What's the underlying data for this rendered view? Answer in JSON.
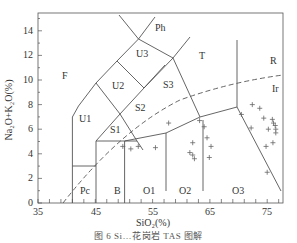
{
  "figure": {
    "caption": "图 6  Si…花岗岩 TAS 图解"
  },
  "axes": {
    "xlabel": "SiO₂(%)",
    "ylabel": "Na₂O+K₂O(%)",
    "xticks": [
      "35",
      "45",
      "55",
      "65",
      "75"
    ],
    "yticks": [
      "0",
      "2",
      "4",
      "6",
      "8",
      "10",
      "12",
      "14"
    ]
  },
  "fields": {
    "F": "F",
    "Ph": "Ph",
    "U3": "U3",
    "U2": "U2",
    "U1": "U1",
    "S3": "S3",
    "S2": "S2",
    "S1": "S1",
    "T": "T",
    "R": "R",
    "Ir": "Ir",
    "Pc": "Pc",
    "B": "B",
    "O1": "O1",
    "O2": "O2",
    "O3": "O3"
  },
  "colors": {
    "lines": "#555555",
    "points": "#666666",
    "text": "#333333"
  },
  "chart_data": {
    "type": "scatter",
    "xlabel": "SiO₂(%)",
    "ylabel": "Na₂O+K₂O(%)",
    "xlim": [
      35,
      77
    ],
    "ylim": [
      0,
      15.4
    ],
    "grid": false,
    "series": [
      {
        "name": "samples",
        "marker": "+",
        "points": [
          [
            49.8,
            4.6
          ],
          [
            51.2,
            4.4
          ],
          [
            52.5,
            4.6
          ],
          [
            55.5,
            4.5
          ],
          [
            57.8,
            6.5
          ],
          [
            62.0,
            4.9
          ],
          [
            61.5,
            4.1
          ],
          [
            62.0,
            3.9
          ],
          [
            62.3,
            3.6
          ],
          [
            63.2,
            6.7
          ],
          [
            64.0,
            6.2
          ],
          [
            64.5,
            5.3
          ],
          [
            65.2,
            4.6
          ],
          [
            64.9,
            3.7
          ],
          [
            70.5,
            7.2
          ],
          [
            72.2,
            6.1
          ],
          [
            72.4,
            8.0
          ],
          [
            73.7,
            7.7
          ],
          [
            74.4,
            6.9
          ],
          [
            74.8,
            4.6
          ],
          [
            75.2,
            6.0
          ],
          [
            75.9,
            6.8
          ],
          [
            76.1,
            6.5
          ],
          [
            76.4,
            6.3
          ],
          [
            76.5,
            6.0
          ],
          [
            76.0,
            4.9
          ],
          [
            76.5,
            5.7
          ],
          [
            75.0,
            2.5
          ]
        ]
      }
    ],
    "annotations": [
      "F",
      "Ph",
      "U3",
      "U2",
      "U1",
      "S3",
      "S2",
      "S1",
      "T",
      "R",
      "Ir",
      "Pc",
      "B",
      "O1",
      "O2",
      "O3"
    ],
    "boundary": "dashed alkaline/subalkaline (Irvine) line"
  }
}
